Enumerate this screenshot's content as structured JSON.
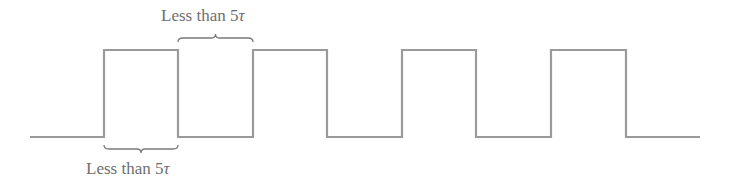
{
  "diagram": {
    "type": "square-wave-timing",
    "line_color": "#9a9a9a",
    "text_color": "#6e6e6e",
    "labels": {
      "top": {
        "prefix": "Less than 5",
        "symbol": "τ"
      },
      "bottom": {
        "prefix": "Less than 5",
        "symbol": "τ"
      }
    },
    "waveform": {
      "baseline_y": 137,
      "high_y": 50,
      "start_x": 30,
      "end_x": 700,
      "rising_edges_x": [
        104,
        253,
        402,
        551
      ],
      "falling_edges_x": [
        178,
        327,
        476,
        626
      ]
    },
    "braces": {
      "top": {
        "x1": 178,
        "x2": 253,
        "y": 38
      },
      "bottom": {
        "x1": 104,
        "x2": 178,
        "y": 149
      }
    }
  }
}
